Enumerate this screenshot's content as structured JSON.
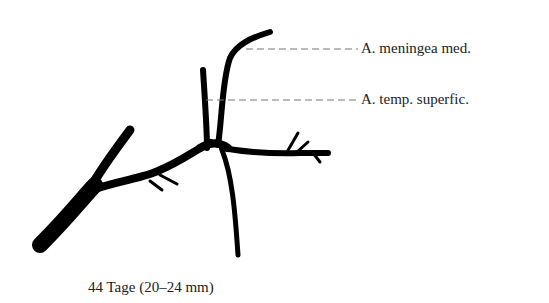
{
  "diagram": {
    "labels": [
      {
        "id": "meningea",
        "text": "A. meningea med."
      },
      {
        "id": "temporalis",
        "text": "A. temp. superfic."
      }
    ],
    "caption": "44 Tage (20–24 mm)",
    "colors": {
      "vessel": "#000000",
      "leader_line": "#777777",
      "text": "#222222",
      "background": "#ffffff"
    }
  }
}
